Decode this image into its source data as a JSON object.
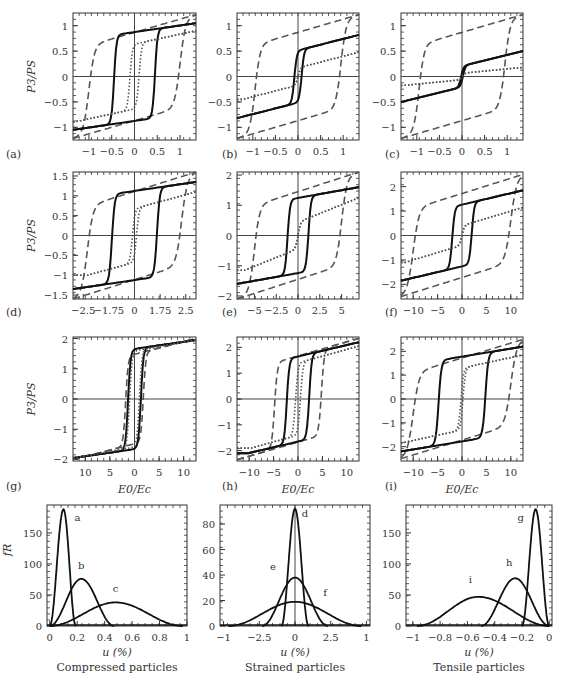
{
  "figure": {
    "ylabel_hyst": "P3/PS",
    "xlabel_hyst": "E0/Ec",
    "ylabel_dist": "fR",
    "xlabel_dist": "u (%)"
  },
  "chart_data": [
    {
      "id": "a",
      "type": "line",
      "panel_label": "(a)",
      "xlabel": "",
      "ylabel": "P3/PS",
      "xlim": [
        -1.35,
        1.35
      ],
      "ylim": [
        -1.25,
        1.25
      ],
      "xticks": [
        -1,
        -0.5,
        0,
        0.5,
        1
      ],
      "xtick_labels": [
        "−1",
        "−0.5",
        "0",
        "0.5",
        "1"
      ],
      "yticks": [
        -1,
        -0.5,
        0,
        0.5,
        1
      ],
      "ytick_labels": [
        "−1",
        "−0.5",
        "0",
        "0.5",
        "1"
      ],
      "loops": [
        {
          "style": "dashed",
          "coercive": 1.0,
          "top": 1.22,
          "knee": 0.68,
          "bottom": -1.22
        },
        {
          "style": "solid",
          "coercive": 0.45,
          "top": 1.05,
          "knee": 0.78,
          "bottom": -1.05,
          "slope": 0.35
        },
        {
          "style": "dotted",
          "coercive": 0.1,
          "top": 0.9,
          "knee": 0.5,
          "bottom": -0.9
        }
      ]
    },
    {
      "id": "b",
      "type": "line",
      "panel_label": "(b)",
      "xlabel": "",
      "ylabel": "",
      "xlim": [
        -1.35,
        1.35
      ],
      "ylim": [
        -1.25,
        1.25
      ],
      "xticks": [
        -1,
        -0.5,
        0,
        0.5,
        1
      ],
      "xtick_labels": [
        "−1",
        "−0.5",
        "0",
        "0.5",
        "1"
      ],
      "yticks": [
        -1,
        -0.5,
        0,
        0.5,
        1
      ],
      "ytick_labels": [
        "−1",
        "−0.5",
        "0",
        "0.5",
        "1"
      ],
      "loops": [
        {
          "style": "dashed",
          "coercive": 0.95,
          "top": 1.22,
          "knee": 0.68,
          "bottom": -1.22
        },
        {
          "style": "solid",
          "coercive": 0.08,
          "top": 0.82,
          "knee": 0.35,
          "bottom": -0.82
        },
        {
          "style": "dotted",
          "coercive": 0.0,
          "top": 0.48,
          "knee": 0.0,
          "bottom": -0.45
        }
      ]
    },
    {
      "id": "c",
      "type": "line",
      "panel_label": "(c)",
      "xlabel": "",
      "ylabel": "",
      "xlim": [
        -1.35,
        1.35
      ],
      "ylim": [
        -1.25,
        1.25
      ],
      "xticks": [
        -1,
        -0.5,
        0,
        0.5,
        1
      ],
      "xtick_labels": [
        "−1",
        "−0.5",
        "0",
        "0.5",
        "1"
      ],
      "yticks": [
        -1,
        -0.5,
        0,
        0.5,
        1
      ],
      "ytick_labels": [
        "−1",
        "−0.5",
        "0",
        "0.5",
        "1"
      ],
      "loops": [
        {
          "style": "dashed",
          "coercive": 0.95,
          "top": 1.22,
          "knee": 0.68,
          "bottom": -1.22
        },
        {
          "style": "solid",
          "coercive": 0.02,
          "top": 0.5,
          "knee": 0.05,
          "bottom": -0.5
        },
        {
          "style": "dotted",
          "coercive": 0.0,
          "top": 0.18,
          "knee": 0.0,
          "bottom": -0.18
        }
      ]
    },
    {
      "id": "d",
      "type": "line",
      "panel_label": "(d)",
      "xlabel": "",
      "ylabel": "P3/PS",
      "xlim": [
        -3.0,
        3.0
      ],
      "ylim": [
        -1.6,
        1.6
      ],
      "xticks": [
        -2.5,
        -1.25,
        0,
        1.25,
        2.5
      ],
      "xtick_labels": [
        "−2.5",
        "−1.75",
        "0",
        "1.75",
        "2.5"
      ],
      "yticks": [
        -1.5,
        -1,
        -0.5,
        0,
        0.5,
        1,
        1.5
      ],
      "ytick_labels": [
        "−1.5",
        "−1",
        "−0.5",
        "0",
        "0.5",
        "1",
        "1.5"
      ],
      "loops": [
        {
          "style": "dashed",
          "coercive": 2.3,
          "top": 1.6,
          "knee": 0.85,
          "bottom": -1.6
        },
        {
          "style": "solid",
          "coercive": 1.1,
          "top": 1.35,
          "knee": 1.0,
          "bottom": -1.35
        },
        {
          "style": "dotted",
          "coercive": 0.1,
          "top": 1.1,
          "knee": 0.45,
          "bottom": -1.0
        }
      ]
    },
    {
      "id": "e",
      "type": "line",
      "panel_label": "(e)",
      "xlabel": "",
      "ylabel": "",
      "xlim": [
        -7,
        7
      ],
      "ylim": [
        -2.1,
        2.1
      ],
      "xticks": [
        -5,
        -2.5,
        0,
        2.5,
        5
      ],
      "xtick_labels": [
        "−5",
        "−2.5",
        "0",
        "2.5",
        "5"
      ],
      "yticks": [
        -2,
        -1,
        0,
        1,
        2
      ],
      "ytick_labels": [
        "−2",
        "−1",
        "0",
        "1",
        "2"
      ],
      "loops": [
        {
          "style": "dashed",
          "coercive": 5.0,
          "top": 2.1,
          "knee": 1.1,
          "bottom": -2.1
        },
        {
          "style": "solid",
          "coercive": 1.2,
          "top": 1.6,
          "knee": 1.05,
          "bottom": -1.6
        },
        {
          "style": "dotted",
          "coercive": 0.0,
          "top": 1.25,
          "knee": 0.0,
          "bottom": -1.15
        }
      ]
    },
    {
      "id": "f",
      "type": "line",
      "panel_label": "(f)",
      "xlabel": "",
      "ylabel": "",
      "xlim": [
        -12.5,
        12.5
      ],
      "ylim": [
        -2.6,
        2.6
      ],
      "xticks": [
        -10,
        -5,
        0,
        5,
        10
      ],
      "xtick_labels": [
        "−10",
        "−5",
        "0",
        "5",
        "10"
      ],
      "yticks": [
        -2,
        -1,
        0,
        1,
        2
      ],
      "ytick_labels": [
        "−2",
        "−1",
        "0",
        "1",
        "2"
      ],
      "loops": [
        {
          "style": "dashed",
          "coercive": 10.0,
          "top": 2.5,
          "knee": 1.3,
          "bottom": -2.5
        },
        {
          "style": "solid",
          "coercive": 2.0,
          "top": 1.85,
          "knee": 0.95,
          "bottom": -1.85
        },
        {
          "style": "dotted",
          "coercive": 0.0,
          "top": 1.15,
          "knee": 0.0,
          "bottom": -1.1
        }
      ]
    },
    {
      "id": "g",
      "type": "line",
      "panel_label": "(g)",
      "xlabel": "E0/Ec",
      "ylabel": "P3/PS",
      "xlim": [
        -12.5,
        12.5
      ],
      "ylim": [
        -2.05,
        2.05
      ],
      "xticks": [
        -10,
        -5,
        0,
        5,
        10
      ],
      "xtick_labels": [
        "10",
        "5",
        "0",
        "5",
        "10"
      ],
      "yticks": [
        -2,
        -1,
        0,
        1,
        2
      ],
      "ytick_labels": [
        "−2",
        "−1",
        "0",
        "1",
        "2"
      ],
      "loops": [
        {
          "style": "dashed",
          "coercive": 1.8,
          "top": 2.0,
          "knee": 1.2,
          "bottom": -2.0
        },
        {
          "style": "solid",
          "coercive": 1.3,
          "top": 1.95,
          "knee": 1.5,
          "bottom": -1.95
        },
        {
          "style": "dotted",
          "coercive": 1.0,
          "top": 1.95,
          "knee": 1.4,
          "bottom": -1.95
        }
      ]
    },
    {
      "id": "h",
      "type": "line",
      "panel_label": "(h)",
      "xlabel": "E0/Ec",
      "ylabel": "",
      "xlim": [
        -12.5,
        12.5
      ],
      "ylim": [
        -2.4,
        2.4
      ],
      "xticks": [
        -10,
        -5,
        0,
        5,
        10
      ],
      "xtick_labels": [
        "−10",
        "−5",
        "0",
        "5",
        "10"
      ],
      "yticks": [
        -2,
        -1,
        0,
        1,
        2
      ],
      "ytick_labels": [
        "−2",
        "−1",
        "0",
        "1",
        "2"
      ],
      "loops": [
        {
          "style": "dashed",
          "coercive": 4.8,
          "top": 2.35,
          "knee": 1.3,
          "bottom": -2.35
        },
        {
          "style": "solid",
          "coercive": 2.3,
          "top": 2.2,
          "knee": 1.35,
          "bottom": -2.1
        },
        {
          "style": "dotted",
          "coercive": 0.5,
          "top": 2.05,
          "knee": 1.05,
          "bottom": -1.9
        }
      ]
    },
    {
      "id": "i",
      "type": "line",
      "panel_label": "(i)",
      "xlabel": "E0/Ec",
      "ylabel": "",
      "xlim": [
        -12.5,
        12.5
      ],
      "ylim": [
        -2.6,
        2.6
      ],
      "xticks": [
        -10,
        -5,
        0,
        5,
        10
      ],
      "xtick_labels": [
        "−10",
        "−5",
        "0",
        "5",
        "10"
      ],
      "yticks": [
        -2,
        -1,
        0,
        1,
        2
      ],
      "ytick_labels": [
        "−2",
        "−1",
        "0",
        "1",
        "2"
      ],
      "loops": [
        {
          "style": "dashed",
          "coercive": 10.0,
          "top": 2.5,
          "knee": 1.3,
          "bottom": -2.5
        },
        {
          "style": "solid",
          "coercive": 4.8,
          "top": 2.2,
          "knee": 1.55,
          "bottom": -2.2
        },
        {
          "style": "dotted",
          "coercive": 0.2,
          "top": 1.85,
          "knee": 1.0,
          "bottom": -1.85
        }
      ]
    },
    {
      "id": "dist-compressed",
      "type": "line",
      "caption": "Compressed particles",
      "xlabel": "u (%)",
      "ylabel": "fR",
      "xlim": [
        -0.02,
        1.0
      ],
      "ylim": [
        0,
        195
      ],
      "xticks": [
        0,
        0.2,
        0.4,
        0.6,
        0.8,
        1
      ],
      "xtick_labels": [
        "0",
        "0.2",
        "0.4",
        "0.6",
        "0.8",
        "1"
      ],
      "yticks": [
        0,
        50,
        100,
        150
      ],
      "ytick_labels": [
        "0",
        "50",
        "100",
        "150"
      ],
      "series": [
        {
          "name": "a",
          "peak_x": 0.1,
          "peak_y": 188,
          "range": [
            0.0,
            0.19
          ]
        },
        {
          "name": "b",
          "peak_x": 0.23,
          "peak_y": 76,
          "range": [
            0.0,
            0.47
          ]
        },
        {
          "name": "c",
          "peak_x": 0.48,
          "peak_y": 38,
          "range": [
            0.0,
            0.97
          ]
        }
      ]
    },
    {
      "id": "dist-strained",
      "type": "line",
      "caption": "Strained particles",
      "xlabel": "u (%)",
      "ylabel": "",
      "xlim": [
        -1.05,
        1.05
      ],
      "ylim": [
        0,
        95
      ],
      "xticks": [
        -1,
        -0.5,
        0,
        0.5,
        1
      ],
      "xtick_labels": [
        "−1",
        "−2.5",
        "0",
        "2.5",
        "1"
      ],
      "yticks": [
        0,
        20,
        40,
        60,
        80
      ],
      "ytick_labels": [
        "0",
        "20",
        "40",
        "60",
        "80"
      ],
      "series": [
        {
          "name": "d",
          "peak_x": 0.0,
          "peak_y": 92,
          "range": [
            -0.19,
            0.19
          ]
        },
        {
          "name": "e",
          "peak_x": 0.0,
          "peak_y": 38,
          "range": [
            -0.46,
            0.46
          ]
        },
        {
          "name": "f",
          "peak_x": 0.0,
          "peak_y": 19,
          "range": [
            -0.93,
            0.93
          ]
        }
      ]
    },
    {
      "id": "dist-tensile",
      "type": "line",
      "caption": "Tensile particles",
      "xlabel": "u (%)",
      "ylabel": "",
      "xlim": [
        -1.05,
        0.02
      ],
      "ylim": [
        0,
        195
      ],
      "xticks": [
        -1,
        -0.8,
        -0.6,
        -0.4,
        -0.2,
        0
      ],
      "xtick_labels": [
        "−1",
        "−0.8",
        "−0.6",
        "−0.4",
        "−0.2",
        "0"
      ],
      "yticks": [
        0,
        50,
        100,
        150
      ],
      "ytick_labels": [
        "0",
        "50",
        "100",
        "150"
      ],
      "series": [
        {
          "name": "g",
          "peak_x": -0.1,
          "peak_y": 188,
          "range": [
            -0.2,
            0.0
          ]
        },
        {
          "name": "h",
          "peak_x": -0.25,
          "peak_y": 77,
          "range": [
            -0.5,
            0.0
          ]
        },
        {
          "name": "i",
          "peak_x": -0.52,
          "peak_y": 47,
          "range": [
            -0.97,
            0.0
          ]
        }
      ]
    }
  ]
}
